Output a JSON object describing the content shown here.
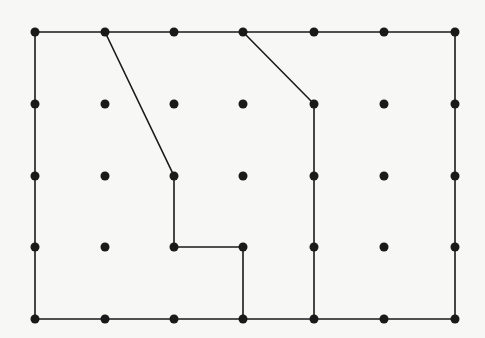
{
  "diagram": {
    "type": "dot-grid-figure",
    "background": "#f7f7f5",
    "ink": "#1a1a1a",
    "grid": {
      "columns": [
        35,
        105,
        174,
        243,
        314,
        384,
        455
      ],
      "rows": [
        32,
        104,
        176,
        247,
        319
      ],
      "dot_radius": 4.5
    },
    "paths": [
      {
        "name": "outer-rectangle",
        "points": [
          [
            35,
            32
          ],
          [
            455,
            32
          ],
          [
            455,
            319
          ],
          [
            35,
            319
          ],
          [
            35,
            32
          ]
        ]
      },
      {
        "name": "left-region-boundary",
        "points": [
          [
            105,
            32
          ],
          [
            174,
            176
          ],
          [
            174,
            247
          ],
          [
            243,
            247
          ],
          [
            243,
            319
          ]
        ]
      },
      {
        "name": "right-region-boundary",
        "points": [
          [
            243,
            32
          ],
          [
            314,
            104
          ],
          [
            314,
            319
          ]
        ]
      }
    ]
  }
}
